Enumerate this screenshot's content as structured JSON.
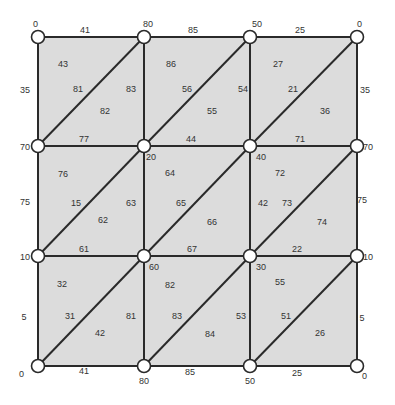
{
  "colors": {
    "cell_fill": "#dcdcdc",
    "edge": "#2a2a2a",
    "node_fill": "#ffffff",
    "text": "#333333"
  },
  "grid": {
    "xs": [
      38,
      144,
      250,
      357
    ],
    "ys": [
      37,
      146,
      256,
      366
    ]
  },
  "nodes": [
    {
      "r": 0,
      "c": 0,
      "label": "0",
      "lx": 33,
      "ly": 27
    },
    {
      "r": 0,
      "c": 1,
      "label": "80",
      "lx": 143,
      "ly": 27
    },
    {
      "r": 0,
      "c": 2,
      "label": "50",
      "lx": 252,
      "ly": 27
    },
    {
      "r": 0,
      "c": 3,
      "label": "0",
      "lx": 357,
      "ly": 27
    },
    {
      "r": 1,
      "c": 0,
      "label": "70",
      "lx": 20,
      "ly": 150
    },
    {
      "r": 1,
      "c": 1,
      "label": "20",
      "lx": 146,
      "ly": 160
    },
    {
      "r": 1,
      "c": 2,
      "label": "40",
      "lx": 256,
      "ly": 160
    },
    {
      "r": 1,
      "c": 3,
      "label": "70",
      "lx": 363,
      "ly": 150
    },
    {
      "r": 2,
      "c": 0,
      "label": "10",
      "lx": 20,
      "ly": 260
    },
    {
      "r": 2,
      "c": 1,
      "label": "60",
      "lx": 149,
      "ly": 270
    },
    {
      "r": 2,
      "c": 2,
      "label": "30",
      "lx": 256,
      "ly": 270
    },
    {
      "r": 2,
      "c": 3,
      "label": "10",
      "lx": 363,
      "ly": 260
    },
    {
      "r": 3,
      "c": 0,
      "label": "0",
      "lx": 19,
      "ly": 377
    },
    {
      "r": 3,
      "c": 1,
      "label": "80",
      "lx": 139,
      "ly": 384
    },
    {
      "r": 3,
      "c": 2,
      "label": "50",
      "lx": 245,
      "ly": 384
    },
    {
      "r": 3,
      "c": 3,
      "label": "0",
      "lx": 362,
      "ly": 379
    }
  ],
  "edge_labels": [
    {
      "text": "41",
      "x": 85,
      "y": 33
    },
    {
      "text": "85",
      "x": 193,
      "y": 33
    },
    {
      "text": "25",
      "x": 300,
      "y": 33
    },
    {
      "text": "35",
      "x": 25,
      "y": 93
    },
    {
      "text": "83",
      "x": 131,
      "y": 92
    },
    {
      "text": "54",
      "x": 243,
      "y": 92
    },
    {
      "text": "35",
      "x": 365,
      "y": 93
    },
    {
      "text": "81",
      "x": 78,
      "y": 92
    },
    {
      "text": "56",
      "x": 187,
      "y": 92
    },
    {
      "text": "21",
      "x": 293,
      "y": 92
    },
    {
      "text": "77",
      "x": 84,
      "y": 142
    },
    {
      "text": "44",
      "x": 191,
      "y": 142
    },
    {
      "text": "71",
      "x": 300,
      "y": 142
    },
    {
      "text": "75",
      "x": 25,
      "y": 205
    },
    {
      "text": "63",
      "x": 131,
      "y": 206
    },
    {
      "text": "42",
      "x": 263,
      "y": 206
    },
    {
      "text": "75",
      "x": 362,
      "y": 203
    },
    {
      "text": "15",
      "x": 76,
      "y": 206
    },
    {
      "text": "65",
      "x": 181,
      "y": 206
    },
    {
      "text": "73",
      "x": 287,
      "y": 206
    },
    {
      "text": "61",
      "x": 84,
      "y": 252
    },
    {
      "text": "67",
      "x": 192,
      "y": 252
    },
    {
      "text": "22",
      "x": 297,
      "y": 252
    },
    {
      "text": "5",
      "x": 24,
      "y": 320
    },
    {
      "text": "81",
      "x": 131,
      "y": 319
    },
    {
      "text": "53",
      "x": 241,
      "y": 319
    },
    {
      "text": "5",
      "x": 362,
      "y": 321
    },
    {
      "text": "31",
      "x": 70,
      "y": 319
    },
    {
      "text": "83",
      "x": 177,
      "y": 319
    },
    {
      "text": "51",
      "x": 286,
      "y": 319
    },
    {
      "text": "41",
      "x": 84,
      "y": 374
    },
    {
      "text": "85",
      "x": 190,
      "y": 375
    },
    {
      "text": "25",
      "x": 297,
      "y": 376
    }
  ],
  "face_labels": [
    {
      "text": "43",
      "x": 63,
      "y": 67
    },
    {
      "text": "82",
      "x": 105,
      "y": 114
    },
    {
      "text": "86",
      "x": 171,
      "y": 67
    },
    {
      "text": "55",
      "x": 212,
      "y": 114
    },
    {
      "text": "27",
      "x": 278,
      "y": 67
    },
    {
      "text": "36",
      "x": 325,
      "y": 114
    },
    {
      "text": "76",
      "x": 63,
      "y": 177
    },
    {
      "text": "62",
      "x": 103,
      "y": 223
    },
    {
      "text": "64",
      "x": 170,
      "y": 176
    },
    {
      "text": "66",
      "x": 212,
      "y": 225
    },
    {
      "text": "72",
      "x": 280,
      "y": 176
    },
    {
      "text": "74",
      "x": 322,
      "y": 225
    },
    {
      "text": "32",
      "x": 62,
      "y": 287
    },
    {
      "text": "42",
      "x": 100,
      "y": 336
    },
    {
      "text": "82",
      "x": 170,
      "y": 288
    },
    {
      "text": "84",
      "x": 210,
      "y": 337
    },
    {
      "text": "55",
      "x": 280,
      "y": 285
    },
    {
      "text": "26",
      "x": 320,
      "y": 336
    }
  ]
}
